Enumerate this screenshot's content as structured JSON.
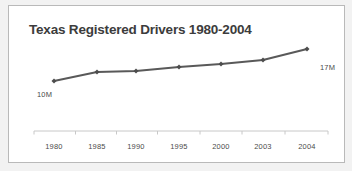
{
  "chart_data": {
    "type": "line",
    "title": "Texas Registered Drivers 1980-2004",
    "xlabel": "",
    "ylabel": "",
    "categories": [
      "1980",
      "1985",
      "1990",
      "1995",
      "2000",
      "2003",
      "2004"
    ],
    "values": [
      10,
      12.4,
      12.7,
      13.8,
      14.6,
      15.7,
      17
    ],
    "series": [
      {
        "name": "Texas Registered Drivers",
        "values": [
          10,
          12.4,
          12.7,
          13.8,
          14.6,
          15.7,
          17
        ]
      }
    ],
    "value_unit": "M",
    "ylim": [
      9,
      18
    ],
    "grid": false,
    "legend": "none",
    "annotations": [
      {
        "text": "10M",
        "point_index": 0,
        "position": "below-left"
      },
      {
        "text": "17M",
        "point_index": 6,
        "position": "right"
      }
    ],
    "colors": {
      "line": "#595959",
      "marker": "#4d4d4d",
      "axis": "#c8c8c8",
      "title_text": "#3c3c3c",
      "tick_text": "#4b4b4b",
      "annotation_text": "#4a4a4a",
      "card_background": "#ffffff",
      "card_border": "#b9b9b9",
      "page_background": "#f2f2f2"
    },
    "points_px": [
      {
        "x": 53,
        "y": 80
      },
      {
        "x": 96,
        "y": 71
      },
      {
        "x": 135,
        "y": 70
      },
      {
        "x": 178,
        "y": 66
      },
      {
        "x": 220,
        "y": 63
      },
      {
        "x": 262,
        "y": 59
      },
      {
        "x": 306,
        "y": 48
      }
    ],
    "axis_line_y_px": 130,
    "axis_x_start_px": 33,
    "axis_x_end_px": 327
  }
}
